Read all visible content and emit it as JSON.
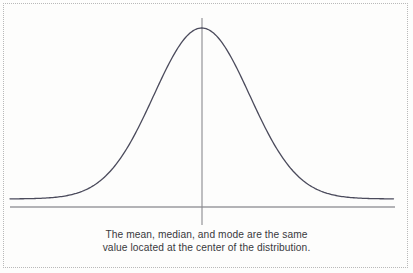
{
  "figure": {
    "name": "normal-distribution-curve",
    "background_color": "#fdfdfc",
    "frame": {
      "style": "dotted",
      "color": "#b9b9b9"
    },
    "caption": {
      "line1": "The mean, median, and mode are the same",
      "line2": "value located at the center of the distribution.",
      "color": "#39393d"
    },
    "axis": {
      "baseline_color": "#6b6b70",
      "center_line_color": "#8a8a8e",
      "center_line_label": ""
    },
    "curve": {
      "color": "#4b4b5c",
      "stroke_width": "1.3"
    }
  },
  "chart_data": {
    "type": "line",
    "title": "",
    "subtitle": "",
    "xlabel": "",
    "ylabel": "",
    "annotations": [
      "The mean, median, and mode are the same",
      "value located at the center of the distribution."
    ],
    "legend": [],
    "legend_position": "none",
    "grid": false,
    "xlim": [
      -4,
      4
    ],
    "ylim": [
      0,
      0.42
    ],
    "distribution": "normal",
    "mean": 0,
    "std_dev": 1,
    "center_marker": {
      "x": 0,
      "label": "mean = median = mode"
    },
    "series": [
      {
        "name": "Normal probability density",
        "x": [
          -4,
          -3.75,
          -3.5,
          -3.25,
          -3,
          -2.75,
          -2.5,
          -2.25,
          -2,
          -1.75,
          -1.5,
          -1.25,
          -1,
          -0.75,
          -0.5,
          -0.25,
          0,
          0.25,
          0.5,
          0.75,
          1,
          1.25,
          1.5,
          1.75,
          2,
          2.25,
          2.5,
          2.75,
          3,
          3.25,
          3.5,
          3.75,
          4
        ],
        "values": [
          0.0001,
          0.0004,
          0.0009,
          0.002,
          0.0044,
          0.0091,
          0.0175,
          0.0317,
          0.054,
          0.0863,
          0.1295,
          0.1826,
          0.242,
          0.3011,
          0.3521,
          0.3867,
          0.3989,
          0.3867,
          0.3521,
          0.3011,
          0.242,
          0.1826,
          0.1295,
          0.0863,
          0.054,
          0.0317,
          0.0175,
          0.0091,
          0.0044,
          0.002,
          0.0009,
          0.0004,
          0.0001
        ]
      }
    ]
  },
  "geometry": {
    "peak_x": 202,
    "peak_y": 28,
    "baseline_y": 207,
    "baseline_x_start": 10,
    "baseline_x_end": 395,
    "center_line_top": 18,
    "center_line_bottom": 225,
    "curve_path": "M 10.0,198.9 L 14.2,198.8 L 18.4,198.7 L 22.5,198.6 L 26.7,198.4 L 30.9,198.1 L 35.1,197.8 L 39.3,197.4 L 43.4,196.9 L 47.6,196.2 L 51.8,195.4 L 56.0,194.3 L 60.2,193.0 L 64.3,191.3 L 68.5,189.3 L 72.7,186.9 L 76.9,184.0 L 81.1,180.6 L 85.2,176.6 L 89.4,172.1 L 93.6,167.0 L 97.8,161.3 L 102.0,155.0 L 106.1,148.3 L 110.3,141.1 L 114.5,133.5 L 118.7,125.7 L 122.9,117.6 L 127.0,109.5 L 131.2,101.4 L 135.4,93.4 L 139.6,85.6 L 143.8,78.2 L 147.9,71.2 L 152.1,64.8 L 156.3,59.0 L 160.5,53.8 L 164.7,49.3 L 168.8,45.6 L 173.0,42.5 L 177.2,40.0 L 181.4,38.0 L 185.6,36.2 L 189.7,34.5 L 193.9,32.4 L 198.1,30.2 L 202.3,28.6 L 206.5,30.2 L 210.6,32.4 L 214.8,34.5 L 219.0,36.2 L 223.2,38.0 L 227.4,40.0 L 231.5,42.5 L 235.7,45.6 L 239.9,49.3 L 244.1,53.8 L 248.3,59.0 L 252.4,64.8 L 256.6,71.2 L 260.8,78.2 L 265.0,85.6 L 269.2,93.4 L 273.3,101.4 L 277.5,109.5 L 281.7,117.6 L 285.9,125.7 L 290.1,133.5 L 294.2,141.1 L 298.4,148.3 L 302.6,155.0 L 306.8,161.3 L 311.0,167.0 L 315.1,172.1 L 319.3,176.6 L 323.5,180.6 L 327.7,184.0 L 331.9,186.9 L 336.0,189.3 L 340.2,191.3 L 344.4,193.0 L 348.6,194.3 L 352.8,195.4 L 356.9,196.2 L 361.1,196.9 L 365.3,197.4 L 369.5,197.8 L 373.7,198.1 L 377.8,198.4 L 382.0,198.6 L 386.2,198.7 L 390.4,198.8 L 393.5,198.9"
  }
}
